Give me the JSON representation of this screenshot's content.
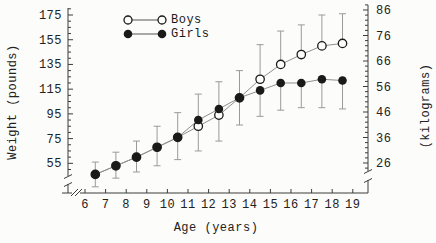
{
  "legend": {
    "boys": "Boys",
    "girls": "Girls"
  },
  "axes": {
    "x_label": "Age (years)",
    "y_left_label": "Weight (pounds)",
    "y_right_label": "(kilograms)"
  },
  "colors": {
    "marker": "#1a1a1a",
    "marker_open_fill": "#fcfcfa",
    "series_line": "#8f8f8f",
    "error_bar": "#9a9a9a",
    "axis": "#3c3c3c",
    "text": "#222222",
    "background": "#fcfcfa"
  },
  "chart_data": {
    "type": "line",
    "title": "",
    "xlabel": "Age (years)",
    "ylabel_left": "Weight (pounds)",
    "ylabel_right": "(kilograms)",
    "x": [
      6.5,
      7.5,
      8.5,
      9.5,
      10.5,
      11.5,
      12.5,
      13.5,
      14.5,
      15.5,
      16.5,
      17.5,
      18.5
    ],
    "x_ticks": [
      6,
      7,
      8,
      9,
      10,
      11,
      12,
      13,
      14,
      15,
      16,
      17,
      18,
      19
    ],
    "y_ticks_left_pounds": [
      55,
      75,
      95,
      115,
      135,
      155,
      175
    ],
    "y_ticks_right_kilograms": [
      26,
      36,
      46,
      56,
      66,
      76,
      86
    ],
    "x_range_years": [
      6,
      19
    ],
    "y_range_pounds": [
      40,
      186
    ],
    "grid": false,
    "legend_position": "top-center",
    "axis_breaks": {
      "x": true,
      "y_left": true,
      "y_right": true
    },
    "series": [
      {
        "name": "Boys",
        "marker": "open-circle",
        "values": [
          46,
          53,
          60,
          68,
          76,
          85,
          94,
          108,
          123,
          135,
          143,
          150,
          152
        ]
      },
      {
        "name": "Girls",
        "marker": "filled-circle",
        "values": [
          46,
          53,
          60,
          68,
          76,
          90,
          99,
          108,
          114,
          120,
          120,
          123,
          122
        ]
      }
    ],
    "error_bars": {
      "style": "upper whisker from higher series point, lower whisker from lower series point, pounds",
      "upper_pounds": [
        10,
        11,
        13,
        17,
        20,
        21,
        22,
        22,
        28,
        27,
        24,
        25,
        24
      ],
      "lower_pounds": [
        10,
        10,
        12,
        15,
        18,
        20,
        21,
        22,
        21,
        22,
        20,
        23,
        23
      ]
    }
  }
}
